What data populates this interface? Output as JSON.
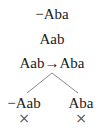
{
  "tree": {
    "trunk": [
      {
        "formula": "−Aba"
      },
      {
        "formula": "Aab"
      },
      {
        "formula": "Aab→Aba"
      }
    ],
    "branches": [
      {
        "formula": "−Aab",
        "closed": true,
        "close_mark": "×"
      },
      {
        "formula": "Aba",
        "closed": true,
        "close_mark": "×"
      }
    ]
  },
  "colors": {
    "text": "#1a1a1a",
    "lines": "#888888",
    "close_mark": "#555555"
  }
}
